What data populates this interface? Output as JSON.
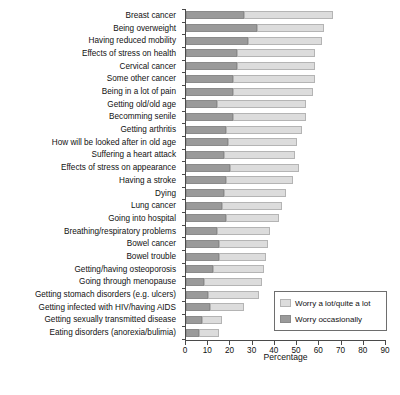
{
  "chart_data": {
    "type": "bar",
    "orientation": "horizontal",
    "stacked": true,
    "title": "",
    "xlabel": "Percentage",
    "ylabel": "",
    "xlim": [
      0,
      90
    ],
    "xticks": [
      0,
      10,
      20,
      30,
      40,
      50,
      60,
      70,
      80,
      90
    ],
    "grid": false,
    "legend_position": "bottom-right",
    "categories": [
      "Breast cancer",
      "Being overweight",
      "Having reduced mobility",
      "Effects of stress on health",
      "Cervical cancer",
      "Some other cancer",
      "Being in a lot of pain",
      "Getting old/old age",
      "Becomming senile",
      "Getting arthritis",
      "How will be looked after in old age",
      "Suffering a heart attack",
      "Effects of stress on appearance",
      "Having a stroke",
      "Dying",
      "Lung cancer",
      "Going into hospital",
      "Breathing/respiratory problems",
      "Bowel cancer",
      "Bowel trouble",
      "Getting/having osteoporosis",
      "Going through menopause",
      "Getting stomach disorders (e.g. ulcers)",
      "Getting infected with HIV/having AIDS",
      "Getting sexually transmitted disease",
      "Eating disorders (anorexia/bulimia)"
    ],
    "series": [
      {
        "name": "Worry occasionally",
        "color": "#9a9a9a",
        "values": [
          26,
          32,
          28,
          23,
          23,
          21,
          21,
          14,
          21,
          18,
          19,
          17,
          20,
          18,
          17,
          16,
          18,
          14,
          15,
          15,
          12,
          8,
          10,
          11,
          7,
          6
        ]
      },
      {
        "name": "Worry a lot/quite a lot",
        "color": "#dcdcdc",
        "values": [
          40,
          30,
          33,
          35,
          35,
          37,
          36,
          40,
          33,
          34,
          31,
          32,
          31,
          30,
          28,
          27,
          24,
          24,
          22,
          21,
          23,
          26,
          23,
          15,
          9,
          9
        ]
      }
    ],
    "totals": [
      66,
      62,
      61,
      58,
      58,
      58,
      57,
      54,
      54,
      52,
      50,
      49,
      51,
      48,
      45,
      43,
      42,
      38,
      37,
      36,
      35,
      34,
      33,
      26,
      16,
      15
    ],
    "legend": [
      {
        "label": "Worry a lot/quite a lot",
        "swatch_color": "#dcdcdc"
      },
      {
        "label": "Worry occasionally",
        "swatch_color": "#9a9a9a"
      }
    ]
  }
}
